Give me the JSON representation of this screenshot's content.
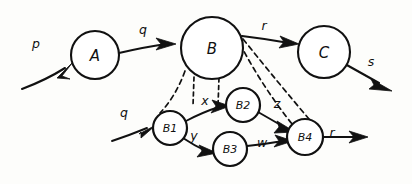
{
  "diagram": {
    "style": "hand-drawn sketch, black ink on white paper",
    "background_color": "#fdfdfb",
    "ink_color": "#111111",
    "top_level_nodes": [
      {
        "id": "A",
        "label": "A",
        "cx": 95,
        "cy": 55,
        "r": 24
      },
      {
        "id": "B",
        "label": "B",
        "cx": 212,
        "cy": 48,
        "r": 31
      },
      {
        "id": "C",
        "label": "C",
        "cx": 324,
        "cy": 52,
        "r": 26
      }
    ],
    "sub_nodes": [
      {
        "id": "B1",
        "label": "B1",
        "cx": 170,
        "cy": 128,
        "r": 17
      },
      {
        "id": "B2",
        "label": "B2",
        "cx": 243,
        "cy": 105,
        "r": 17
      },
      {
        "id": "B3",
        "label": "B3",
        "cx": 230,
        "cy": 149,
        "r": 17
      },
      {
        "id": "B4",
        "label": "B4",
        "cx": 305,
        "cy": 137,
        "r": 18
      }
    ],
    "edges": [
      {
        "id": "in-p",
        "from": "",
        "to": "A",
        "label": "p",
        "label_x": 36,
        "label_y": 44,
        "kind": "input"
      },
      {
        "id": "a-to-b",
        "from": "A",
        "to": "B",
        "label": "q",
        "label_x": 143,
        "label_y": 30,
        "kind": "solid"
      },
      {
        "id": "b-to-c",
        "from": "B",
        "to": "C",
        "label": "r",
        "label_x": 264,
        "label_y": 26,
        "kind": "solid"
      },
      {
        "id": "out-s",
        "from": "C",
        "to": "",
        "label": "s",
        "label_x": 371,
        "label_y": 62,
        "kind": "output"
      },
      {
        "id": "in-q-b1",
        "from": "",
        "to": "B1",
        "label": "q",
        "label_x": 124,
        "label_y": 113,
        "kind": "input"
      },
      {
        "id": "b1-to-b2",
        "from": "B1",
        "to": "B2",
        "label": "x",
        "label_x": 203,
        "label_y": 101,
        "kind": "solid"
      },
      {
        "id": "b1-to-b3",
        "from": "B1",
        "to": "B3",
        "label": "y",
        "label_x": 194,
        "label_y": 136,
        "kind": "solid"
      },
      {
        "id": "b2-to-b4",
        "from": "B2",
        "to": "B4",
        "label": "z",
        "label_x": 277,
        "label_y": 104,
        "kind": "solid"
      },
      {
        "id": "b3-to-b4",
        "from": "B3",
        "to": "B4",
        "label": "w",
        "label_x": 262,
        "label_y": 143,
        "kind": "solid"
      },
      {
        "id": "out-r-b4",
        "from": "B4",
        "to": "",
        "label": "r",
        "label_x": 330,
        "label_y": 134,
        "kind": "output"
      }
    ],
    "refinement_links": [
      {
        "id": "b-left-to-b1",
        "desc": "dashed line from B lower-left to B1"
      },
      {
        "id": "b-right-to-b4",
        "desc": "dashed line from B lower-right to B4"
      },
      {
        "id": "b-right-to-b4b",
        "desc": "second dashed line from B right side to B4"
      },
      {
        "id": "x-bracket-left",
        "desc": "short dashed tick from B bottom to left of label x"
      },
      {
        "id": "x-bracket-right",
        "desc": "short dashed tick from B bottom to right of label x"
      }
    ]
  }
}
